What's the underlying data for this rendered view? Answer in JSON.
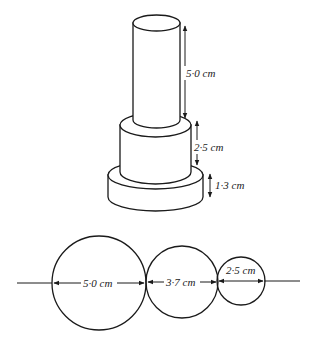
{
  "figure": {
    "stacked_cylinders": {
      "parts": [
        {
          "name": "top-cylinder",
          "height_label": "5·0 cm"
        },
        {
          "name": "middle-cylinder",
          "height_label": "2·5 cm"
        },
        {
          "name": "base-cylinder",
          "height_label": "1·3 cm"
        }
      ]
    },
    "circles": {
      "items": [
        {
          "name": "large-circle",
          "diameter_label": "5·0 cm"
        },
        {
          "name": "medium-circle",
          "diameter_label": "3·7 cm"
        },
        {
          "name": "small-circle",
          "diameter_label": "2·5 cm"
        }
      ]
    }
  }
}
